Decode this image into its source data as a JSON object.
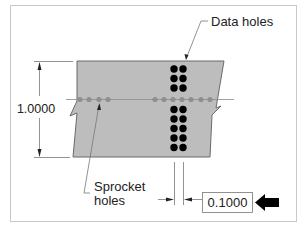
{
  "figure": {
    "labels": {
      "data_holes": "Data holes",
      "sprocket_line1": "Sprocket",
      "sprocket_line2": "holes",
      "height_dim": "1.0000",
      "spacing_dim": "0.1000"
    },
    "colors": {
      "frame": "#c8c8c8",
      "tape_fill": "#bdbdbd",
      "tape_edge": "#6b6b6b",
      "sprocket_hole": "#8f8f8f",
      "data_hole": "#000000",
      "dim_line": "#555555",
      "text": "#222222"
    },
    "sprocket_holes_x": [
      80,
      89,
      99,
      108,
      155,
      164,
      173,
      182,
      191,
      201,
      210
    ],
    "data_hole_columns_x": [
      174,
      183
    ],
    "data_hole_rows_y": [
      69,
      78,
      88,
      109,
      118,
      128,
      137,
      147
    ]
  }
}
